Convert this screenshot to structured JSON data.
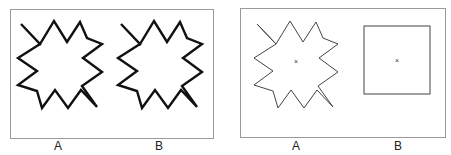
{
  "figure": {
    "left_panel": {
      "shapes": [
        {
          "id": "star-a",
          "style": "thick-stroke",
          "label": "A"
        },
        {
          "id": "star-b",
          "style": "thick-stroke",
          "label": "B"
        }
      ]
    },
    "right_panel": {
      "shapes": [
        {
          "id": "star-a",
          "style": "thin-stroke",
          "center_mark": "×",
          "label": "A"
        },
        {
          "id": "square-b",
          "style": "thin-stroke",
          "center_mark": "×",
          "label": "B"
        }
      ]
    },
    "colors": {
      "stroke": "#111111",
      "thin_stroke": "#444444",
      "border": "#9a9a9a",
      "background": "#ffffff"
    }
  }
}
